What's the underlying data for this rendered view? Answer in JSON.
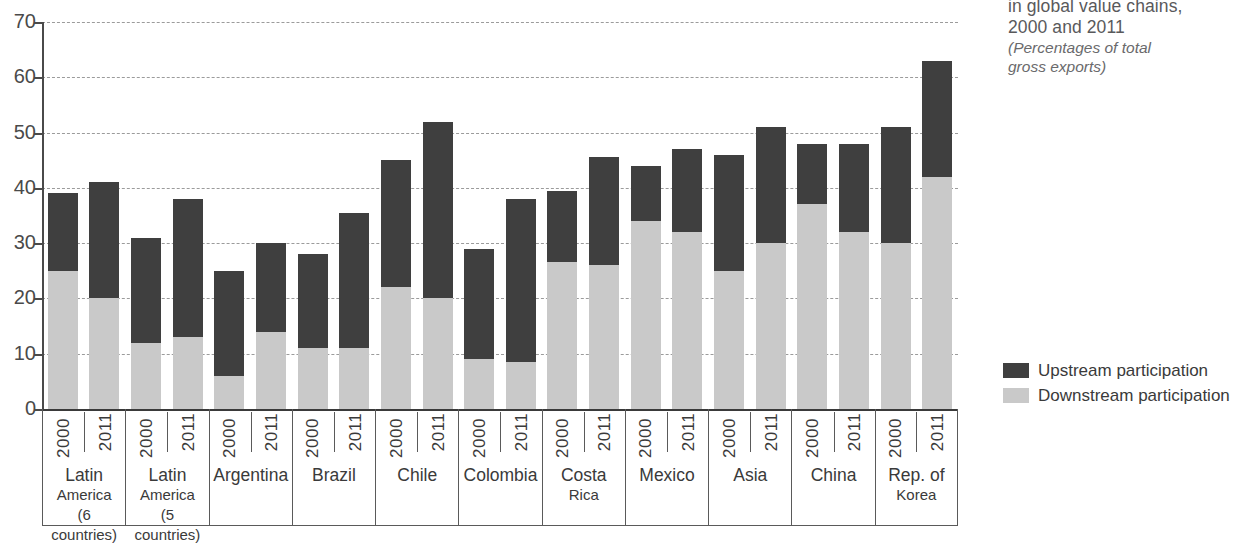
{
  "title": {
    "line1": "in global value chains,",
    "line2": "2000 and 2011",
    "subtitle1": "(Percentages of total",
    "subtitle2": "gross exports)"
  },
  "legend": {
    "upstream_label": "Upstream participation",
    "downstream_label": "Downstream participation",
    "upstream_color": "#3f3f3f",
    "downstream_color": "#c9c9c9"
  },
  "axis": {
    "y_ticks": [
      "0",
      "10",
      "20",
      "30",
      "40",
      "50",
      "60",
      "70"
    ],
    "y_min": 0,
    "y_max": 70,
    "year_left": "2000",
    "year_right": "2011"
  },
  "chart_data": {
    "type": "bar",
    "title": "in global value chains, 2000 and 2011",
    "subtitle": "(Percentages of total gross exports)",
    "xlabel": "",
    "ylabel": "",
    "ylim": [
      0,
      70
    ],
    "ytick_step": 10,
    "grid": true,
    "stacked": true,
    "legend_position": "right",
    "categories": [
      "Latin America (6 countries)",
      "Latin America (5 countries)",
      "Argentina",
      "Brazil",
      "Chile",
      "Colombia",
      "Costa Rica",
      "Mexico",
      "Asia",
      "China",
      "Rep. of Korea"
    ],
    "category_lines": [
      [
        "Latin",
        "America",
        "(6 countries)"
      ],
      [
        "Latin",
        "America",
        "(5 countries)"
      ],
      [
        "Argentina"
      ],
      [
        "Brazil"
      ],
      [
        "Chile"
      ],
      [
        "Colombia"
      ],
      [
        "Costa",
        "Rica"
      ],
      [
        "Mexico"
      ],
      [
        "Asia"
      ],
      [
        "China"
      ],
      [
        "Rep. of",
        "Korea"
      ]
    ],
    "years": [
      "2000",
      "2011"
    ],
    "series": [
      {
        "name": "Downstream participation",
        "color": "#c9c9c9",
        "values_2000": [
          25,
          12,
          6,
          11,
          22,
          9,
          26.5,
          34,
          25,
          37,
          30
        ],
        "values_2011": [
          20,
          13,
          14,
          11,
          20,
          8.5,
          26,
          32,
          30,
          32,
          42
        ]
      },
      {
        "name": "Upstream participation",
        "color": "#3f3f3f",
        "values_2000": [
          14,
          19,
          19,
          17,
          23,
          20,
          13,
          10,
          21,
          11,
          21
        ],
        "values_2011": [
          21,
          25,
          16,
          24.5,
          32,
          29.5,
          19.5,
          15,
          21,
          16,
          21
        ]
      }
    ],
    "totals_2000": [
      39,
      31,
      25,
      28,
      45,
      29,
      39.5,
      44,
      46,
      48,
      51
    ],
    "totals_2011": [
      41,
      38,
      30,
      35.5,
      52,
      38,
      45.5,
      47,
      51,
      48,
      63
    ]
  }
}
